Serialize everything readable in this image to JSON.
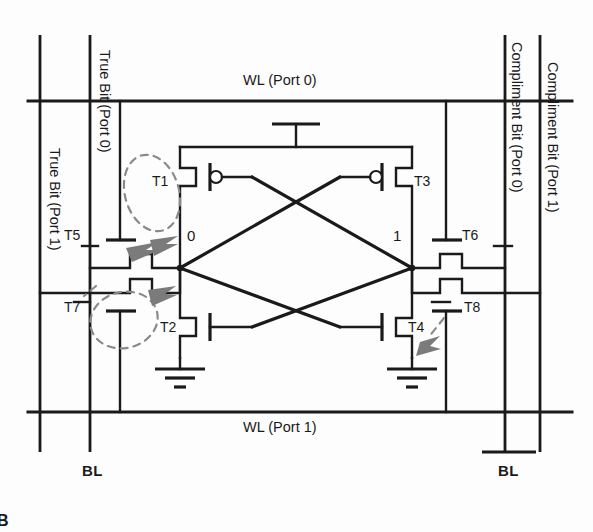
{
  "diagram": {
    "type": "circuit-schematic",
    "ink_color": "#1a1a1a",
    "annotation_color": "#7d7d7d",
    "background": "#fdfdfd"
  },
  "bitlines": [
    {
      "id": "bl-true-port1",
      "label": "True Bit (Port 1)",
      "x": 40,
      "orientation": "vertical"
    },
    {
      "id": "bl-true-port0",
      "label": "True Bit (Port 0)",
      "x": 90,
      "orientation": "vertical"
    },
    {
      "id": "bl-comp-port0",
      "label": "Compliment Bit (Port 0)",
      "x": 505,
      "orientation": "vertical"
    },
    {
      "id": "bl-comp-port1",
      "label": "Compliment Bit (Port 1)",
      "x": 540,
      "orientation": "vertical"
    }
  ],
  "wordlines": [
    {
      "id": "wl-port0",
      "label": "WL (Port 0)",
      "y": 101
    },
    {
      "id": "wl-port1",
      "label": "WL (Port 1)",
      "y": 412
    }
  ],
  "transistors": [
    {
      "id": "T1",
      "label": "T1",
      "kind": "pmos",
      "role": "pull-up-left",
      "lx": 152,
      "ly": 174
    },
    {
      "id": "T2",
      "label": "T2",
      "kind": "nmos",
      "role": "pull-down-left",
      "lx": 160,
      "ly": 327
    },
    {
      "id": "T3",
      "label": "T3",
      "kind": "pmos",
      "role": "pull-up-right",
      "lx": 414,
      "ly": 174
    },
    {
      "id": "T4",
      "label": "T4",
      "kind": "nmos",
      "role": "pull-down-right",
      "lx": 412,
      "ly": 327
    },
    {
      "id": "T5",
      "label": "T5",
      "kind": "nmos",
      "role": "access-true-port0",
      "lx": 66,
      "ly": 231
    },
    {
      "id": "T6",
      "label": "T6",
      "kind": "nmos",
      "role": "access-comp-port0",
      "lx": 461,
      "ly": 231
    },
    {
      "id": "T7",
      "label": "T7",
      "kind": "nmos",
      "role": "access-true-port1",
      "lx": 66,
      "ly": 303
    },
    {
      "id": "T8",
      "label": "T8",
      "kind": "nmos",
      "role": "access-comp-port1",
      "lx": 461,
      "ly": 303
    }
  ],
  "nodes": [
    {
      "id": "node-q",
      "label": "0",
      "lx": 186,
      "ly": 230
    },
    {
      "id": "node-qbar",
      "label": "1",
      "lx": 395,
      "ly": 230
    }
  ],
  "power": {
    "vdd_label": "",
    "gnd_left_label": "",
    "gnd_right_label": ""
  },
  "footers": [
    {
      "id": "bl-left",
      "label": "BL",
      "lx": 85,
      "ly": 468,
      "overline": false
    },
    {
      "id": "bl-right",
      "label": "BL",
      "lx": 505,
      "ly": 468,
      "overline": true
    }
  ],
  "edge_glyph": {
    "label": "B",
    "lx": 0,
    "ly": 512
  },
  "annotations": [
    {
      "id": "ann-t1",
      "target": "T1",
      "shape": "dashed-ellipse",
      "cx": 152,
      "cy": 192,
      "rx": 28,
      "ry": 38,
      "rot": -18
    },
    {
      "id": "ann-t2",
      "target": "T2",
      "shape": "dashed-ellipse",
      "cx": 120,
      "cy": 318,
      "rx": 32,
      "ry": 28,
      "rot": -12
    },
    {
      "id": "ann-t4",
      "target": "T4",
      "shape": "dashed-line",
      "cx": 430,
      "cy": 330
    }
  ]
}
